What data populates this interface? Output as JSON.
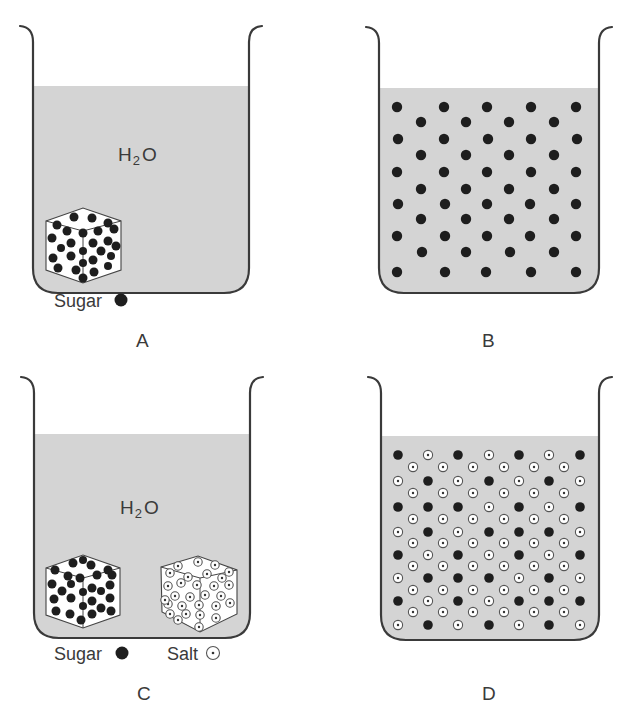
{
  "figure": {
    "panels": [
      {
        "id": "A",
        "label": "A",
        "solvent_label": "H",
        "solvent_sub": "2",
        "solvent_tail": "O",
        "state": "undissolved",
        "cubes": [
          {
            "type": "sugar"
          }
        ],
        "legend": [
          {
            "text": "Sugar",
            "symbol": "filled-dot"
          }
        ]
      },
      {
        "id": "B",
        "label": "B",
        "state": "dissolved",
        "particles": "sugar only"
      },
      {
        "id": "C",
        "label": "C",
        "solvent_label": "H",
        "solvent_sub": "2",
        "solvent_tail": "O",
        "state": "undissolved",
        "cubes": [
          {
            "type": "sugar"
          },
          {
            "type": "salt"
          }
        ],
        "legend": [
          {
            "text": "Sugar",
            "symbol": "filled-dot"
          },
          {
            "text": "Salt",
            "symbol": "dotted-circle"
          }
        ]
      },
      {
        "id": "D",
        "label": "D",
        "state": "dissolved",
        "particles": "sugar and salt mixed"
      }
    ],
    "colors": {
      "liquid": "#d4d4d4",
      "outline": "#3a3a3a",
      "sugar": "#1e1e1e",
      "salt_ring": "#ffffff"
    },
    "grid_B": {
      "rows": [
        {
          "y": 107,
          "xs": [
            397,
            444,
            487,
            531,
            576
          ]
        },
        {
          "y": 122,
          "xs": [
            421,
            466,
            509,
            554
          ]
        },
        {
          "y": 139,
          "xs": [
            398,
            444,
            488,
            531,
            577
          ]
        },
        {
          "y": 155,
          "xs": [
            421,
            466,
            509,
            554
          ]
        },
        {
          "y": 172,
          "xs": [
            397,
            444,
            487,
            531,
            576
          ]
        },
        {
          "y": 189,
          "xs": [
            421,
            466,
            509,
            554
          ]
        },
        {
          "y": 204,
          "xs": [
            398,
            445,
            487,
            530,
            576
          ]
        },
        {
          "y": 219,
          "xs": [
            421,
            466,
            509,
            554
          ]
        },
        {
          "y": 236,
          "xs": [
            397,
            445,
            487,
            530,
            576
          ]
        },
        {
          "y": 252,
          "xs": [
            422,
            466,
            510,
            554
          ]
        },
        {
          "y": 272,
          "xs": [
            397,
            445,
            486,
            531,
            576
          ]
        }
      ]
    },
    "grid_D": {
      "x7": [
        398,
        428,
        458,
        489,
        519,
        549,
        580
      ],
      "x6": [
        413,
        443,
        473,
        504,
        534,
        564
      ],
      "rows": [
        {
          "y": 455,
          "n": 7,
          "pattern": "SsSsSsS"
        },
        {
          "y": 467,
          "n": 6,
          "pattern": "ssssss"
        },
        {
          "y": 481,
          "n": 7,
          "pattern": "sSsSsSs"
        },
        {
          "y": 493,
          "n": 6,
          "pattern": "ssssss"
        },
        {
          "y": 507,
          "n": 7,
          "pattern": "SSSsSsS"
        },
        {
          "y": 519,
          "n": 6,
          "pattern": "ssssss"
        },
        {
          "y": 532,
          "n": 7,
          "pattern": "sSsSSSs"
        },
        {
          "y": 543,
          "n": 6,
          "pattern": "ssssss"
        },
        {
          "y": 555,
          "n": 7,
          "pattern": "SsSsSsS"
        },
        {
          "y": 566,
          "n": 6,
          "pattern": "ssssss"
        },
        {
          "y": 578,
          "n": 7,
          "pattern": "sSSSsSs"
        },
        {
          "y": 590,
          "n": 6,
          "pattern": "ssssss"
        },
        {
          "y": 601,
          "n": 7,
          "pattern": "SsSsSSS"
        },
        {
          "y": 612,
          "n": 6,
          "pattern": "ssssss"
        },
        {
          "y": 625,
          "n": 7,
          "pattern": "sSsSsSs"
        }
      ]
    }
  }
}
